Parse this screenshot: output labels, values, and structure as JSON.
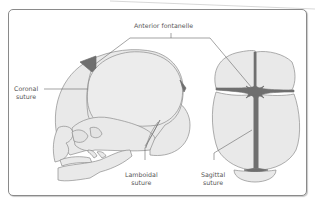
{
  "diagram": {
    "views": [
      "lateral-skull",
      "superior-skull"
    ],
    "labels": {
      "anterior_fontanelle": "Anterior fontanelle",
      "coronal_line1": "Coronal",
      "coronal_line2": "suture",
      "lamboidal_line1": "Lamboidal",
      "lamboidal_line2": "suture",
      "sagittal_line1": "Sagittal",
      "sagittal_line2": "suture"
    },
    "colors": {
      "bone_fill": "#e9e9e9",
      "bone_outline": "#8c8c8c",
      "suture_dark": "#6f6f6f",
      "leader_line": "#666666",
      "frame_border": "#8a8a8a",
      "text": "#555555"
    }
  }
}
